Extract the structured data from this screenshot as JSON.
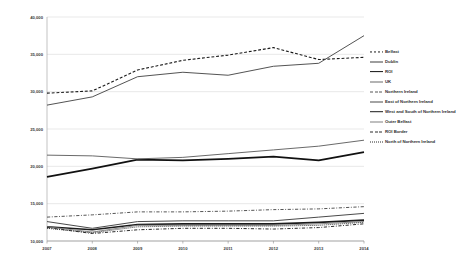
{
  "chart_data": {
    "type": "line",
    "title": "",
    "xlabel": "",
    "ylabel": "",
    "grid": true,
    "legend_position": "right",
    "x": [
      2007,
      2008,
      2009,
      2010,
      2011,
      2012,
      2013,
      2014
    ],
    "xtick_labels": [
      "2007",
      "2008",
      "2009",
      "2010",
      "2011",
      "2012",
      "2013",
      "2014"
    ],
    "ytick_labels": [
      "40,000",
      "35,000",
      "30,000",
      "25,000",
      "20,000",
      "15,000",
      "10,000"
    ],
    "ytick_values": [
      40000,
      35000,
      30000,
      25000,
      20000,
      15000,
      10000
    ],
    "ylim": [
      10000,
      40000
    ],
    "xlim": [
      2007,
      2014
    ],
    "series": [
      {
        "name": "Belfast",
        "style": "dashed",
        "color": "#1a1a1a",
        "width": 1.1,
        "values": [
          29800,
          30100,
          32900,
          34200,
          34900,
          35900,
          34300,
          34600
        ]
      },
      {
        "name": "Dublin",
        "style": "solid",
        "color": "#3f3f3f",
        "width": 0.9,
        "values": [
          28200,
          29300,
          32000,
          32600,
          32200,
          33400,
          33800,
          37500
        ]
      },
      {
        "name": "ROI",
        "style": "solid-thick",
        "color": "#111111",
        "width": 1.8,
        "values": [
          18600,
          19700,
          20900,
          20800,
          21000,
          21300,
          20800,
          21900
        ]
      },
      {
        "name": "UK",
        "style": "solid",
        "color": "#6a6a6a",
        "width": 1.0,
        "values": [
          21500,
          21400,
          21000,
          21200,
          21700,
          22200,
          22700,
          23500
        ]
      },
      {
        "name": "Northern Ireland",
        "style": "dashdot",
        "color": "#555555",
        "width": 1.0,
        "values": [
          13200,
          13500,
          13900,
          13900,
          14000,
          14200,
          14300,
          14600
        ]
      },
      {
        "name": "East of Northern Ireland",
        "style": "solid",
        "color": "#4a4a4a",
        "width": 1.0,
        "values": [
          12600,
          11700,
          12600,
          12700,
          12700,
          12700,
          13200,
          13700
        ]
      },
      {
        "name": "West and South of Northern Ireland",
        "style": "solid-thick",
        "color": "#1a1a1a",
        "width": 1.6,
        "values": [
          11900,
          11500,
          12200,
          12300,
          12300,
          12300,
          12500,
          12800
        ]
      },
      {
        "name": "Outer Belfast",
        "style": "solid",
        "color": "#808080",
        "width": 0.9,
        "values": [
          11900,
          11200,
          12100,
          12100,
          12100,
          12100,
          12300,
          12600
        ]
      },
      {
        "name": "ROI Border",
        "style": "dashdot",
        "color": "#2b2b2b",
        "width": 1.0,
        "values": [
          11800,
          11000,
          11500,
          11700,
          11700,
          11600,
          11800,
          12300
        ]
      },
      {
        "name": "North of Northern Ireland",
        "style": "dotted",
        "color": "#2b2b2b",
        "width": 1.0,
        "values": [
          11700,
          11100,
          11900,
          12000,
          12000,
          12000,
          12100,
          12500
        ]
      }
    ]
  },
  "legend": {
    "items": [
      {
        "label": "Belfast"
      },
      {
        "label": "Dublin"
      },
      {
        "label": "ROI"
      },
      {
        "label": "UK"
      },
      {
        "label": "Northern Ireland"
      },
      {
        "label": "East of Northern Ireland"
      },
      {
        "label": "West and South of Northern Ireland"
      },
      {
        "label": "Outer Belfast"
      },
      {
        "label": "ROI Border"
      },
      {
        "label": "North of Northern Ireland"
      }
    ]
  }
}
